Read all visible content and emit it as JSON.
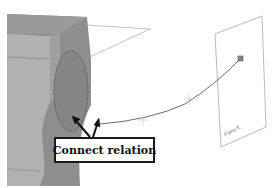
{
  "diagram": {
    "callout": {
      "label": "Connect relation"
    },
    "plane": {
      "label": "Plane E"
    },
    "colors": {
      "part_dark": "#8a8a8a",
      "part_mid": "#9c9c9c",
      "part_light": "#b4b4b4",
      "ellipse_face": "#858585",
      "ellipse_edge": "#555555",
      "curve": "#6a6a6a",
      "plane_edge": "#a8a8a8",
      "arrow": "#111111"
    }
  }
}
